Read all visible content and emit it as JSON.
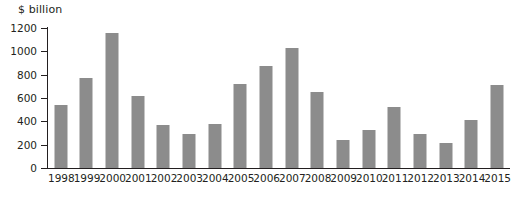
{
  "chart_data": {
    "type": "bar",
    "title": "",
    "subtitle": "",
    "xlabel": "",
    "ylabel": "$ billion",
    "ylim": [
      0,
      1200
    ],
    "yticks": [
      0,
      200,
      400,
      600,
      800,
      1000,
      1200
    ],
    "ytick_labels": [
      "0",
      "200",
      "400",
      "600",
      "800",
      "1000",
      "1200"
    ],
    "grid": false,
    "legend": null,
    "bar_color": "#8c8c8c",
    "axis_color": "#231f20",
    "background": "#ffffff",
    "categories": [
      "1998",
      "1999",
      "2000",
      "2001",
      "2002",
      "2003",
      "2004",
      "2005",
      "2006",
      "2007",
      "2008",
      "2009",
      "2010",
      "2011",
      "2012",
      "2013",
      "2014",
      "2015"
    ],
    "values": [
      540,
      775,
      1160,
      615,
      370,
      290,
      380,
      720,
      875,
      1030,
      655,
      240,
      330,
      520,
      295,
      215,
      410,
      710
    ]
  }
}
